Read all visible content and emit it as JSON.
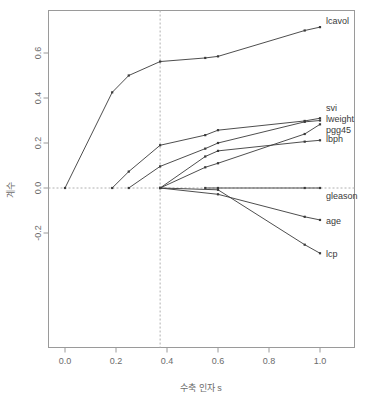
{
  "chart_data": {
    "type": "line",
    "title": "",
    "subtitle": "",
    "xlabel": "수축 인자 s",
    "ylabel": "계수",
    "xlim": [
      -0.04,
      1.1
    ],
    "ylim": [
      -0.33,
      0.75
    ],
    "grid": false,
    "legend_position": "right-inline-labels",
    "xticks": [
      0.0,
      0.2,
      0.4,
      0.6,
      0.8,
      1.0
    ],
    "xtick_labels": [
      "0.0",
      "0.2",
      "0.4",
      "0.6",
      "0.8",
      "1.0"
    ],
    "yticks": [
      -0.2,
      0.0,
      0.2,
      0.4,
      0.6
    ],
    "ytick_labels": [
      "-0.2",
      "0.0",
      "0.2",
      "0.4",
      "0.6"
    ],
    "annotations": [
      {
        "name": "vertical-dashed-line",
        "type": "vline",
        "x": 0.373,
        "style": "dashed"
      },
      {
        "name": "horizontal-zero-line",
        "type": "hline",
        "y": 0.0,
        "style": "dashed"
      }
    ],
    "x": [
      0.0,
      0.185,
      0.25,
      0.373,
      0.55,
      0.6,
      0.94,
      1.0
    ],
    "series": [
      {
        "name": "lcavol",
        "label": "lcavol",
        "x": [
          0.0,
          0.185,
          0.25,
          0.373,
          0.55,
          0.6,
          0.94,
          1.0
        ],
        "values": [
          0.0,
          0.425,
          0.5,
          0.562,
          0.578,
          0.585,
          0.7,
          0.715
        ]
      },
      {
        "name": "svi",
        "label": "svi",
        "x": [
          0.185,
          0.25,
          0.373,
          0.55,
          0.6,
          0.94,
          1.0
        ],
        "values": [
          0.0,
          0.073,
          0.19,
          0.235,
          0.257,
          0.298,
          0.31
        ]
      },
      {
        "name": "lweight",
        "label": "lweight",
        "x": [
          0.25,
          0.373,
          0.55,
          0.6,
          0.94,
          1.0
        ],
        "values": [
          0.0,
          0.096,
          0.175,
          0.2,
          0.294,
          0.3
        ]
      },
      {
        "name": "pgg45",
        "label": "pgg45",
        "x": [
          0.373,
          0.55,
          0.6,
          0.94,
          1.0
        ],
        "values": [
          0.0,
          0.092,
          0.11,
          0.24,
          0.283
        ]
      },
      {
        "name": "lbph",
        "label": "lbph",
        "x": [
          0.373,
          0.55,
          0.6,
          0.94,
          1.0
        ],
        "values": [
          0.0,
          0.14,
          0.165,
          0.206,
          0.212
        ]
      },
      {
        "name": "gleason",
        "label": "gleason",
        "x": [
          0.55,
          0.6,
          0.94,
          1.0
        ],
        "values": [
          0.0,
          0.0,
          0.0,
          0.0
        ]
      },
      {
        "name": "age",
        "label": "age",
        "x": [
          0.373,
          0.6,
          0.94,
          1.0
        ],
        "values": [
          0.0,
          -0.028,
          -0.128,
          -0.142
        ]
      },
      {
        "name": "lcp",
        "label": "lcp",
        "x": [
          0.373,
          0.6,
          0.94,
          1.0
        ],
        "values": [
          0.0,
          -0.008,
          -0.252,
          -0.29
        ]
      }
    ],
    "colors": {
      "line": "#3a3a3a",
      "axis": "#8a8a8a",
      "dashed": "#a8a8a8",
      "background": "#ffffff"
    }
  }
}
